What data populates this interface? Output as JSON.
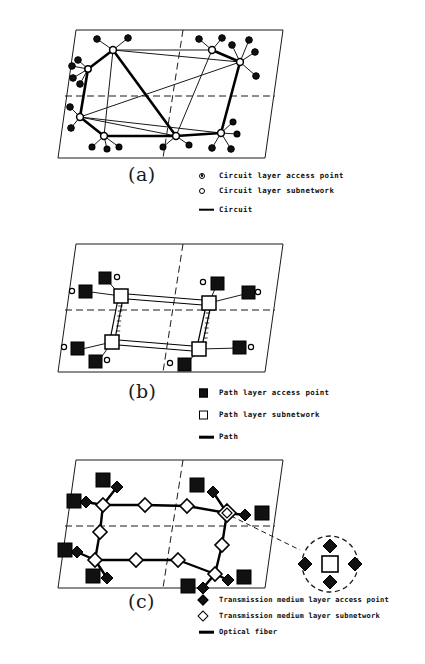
{
  "figure": {
    "caption_style": "three-panel layered transport network diagram"
  },
  "panels": [
    {
      "id": "a",
      "label": "(a)",
      "plane_name": "circuit-layer-plane",
      "legend": [
        {
          "key": "filled-circle-icon",
          "label": "Circuit layer access point"
        },
        {
          "key": "open-circle-icon",
          "label": "Circuit layer subnetwork"
        },
        {
          "key": "thick-line-icon",
          "label": "Circuit"
        }
      ]
    },
    {
      "id": "b",
      "label": "(b)",
      "plane_name": "path-layer-plane",
      "legend": [
        {
          "key": "filled-square-icon",
          "label": "Path layer access point"
        },
        {
          "key": "open-square-icon",
          "label": "Path layer subnetwork"
        },
        {
          "key": "thick-line-icon",
          "label": "Path"
        }
      ]
    },
    {
      "id": "c",
      "label": "(c)",
      "plane_name": "transmission-medium-layer-plane",
      "legend": [
        {
          "key": "filled-diamond-icon",
          "label": "Transmission medium layer access point"
        },
        {
          "key": "open-diamond-icon",
          "label": "Transmission medium layer subnetwork"
        },
        {
          "key": "thick-line-icon",
          "label": "Optical fiber"
        }
      ]
    }
  ],
  "colors": {
    "ink": "#000000",
    "background": "#ffffff",
    "fill_dark": "#111111",
    "fill_light": "#ffffff"
  }
}
